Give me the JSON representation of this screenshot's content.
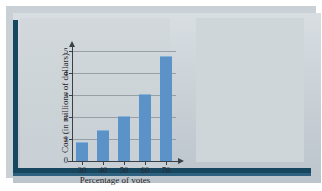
{
  "figure": {
    "name": "bar-chart-with-voting-photo"
  },
  "chart_data": {
    "type": "bar",
    "title": "",
    "xlabel": "Percentage of votes",
    "ylabel": "Cost (in millions of dollars)",
    "categories": [
      "30",
      "40",
      "50",
      "60",
      "70"
    ],
    "values": [
      0.8,
      1.35,
      2.0,
      3.0,
      4.75
    ],
    "ylim": [
      0,
      5
    ],
    "yticks": [
      "0",
      "1",
      "2",
      "3",
      "4",
      "5"
    ],
    "xticks": [
      "30",
      "40",
      "50",
      "60",
      "70"
    ],
    "grid": true,
    "legend": "none",
    "bar_color": "#5b93c8",
    "panel_color": "#ccd3d8",
    "axis_color": "#3a4146"
  },
  "photo": {
    "caption": "",
    "alt_name": "voting-booth-photograph",
    "sign_text": "VOTE",
    "sign_graphic": "stars-and-stripes-top-hat",
    "frame_color": "#17465f"
  }
}
